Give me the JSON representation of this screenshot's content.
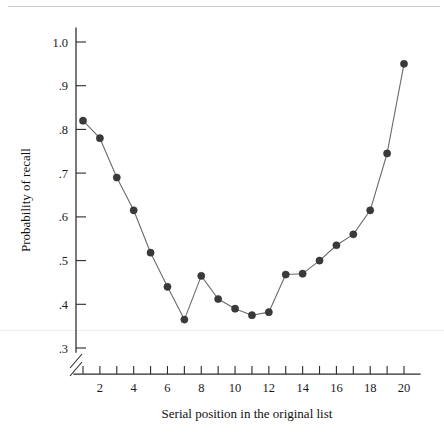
{
  "chart_data": {
    "type": "line",
    "title": "",
    "subtitle": "",
    "xlabel": "Serial position in the original list",
    "ylabel": "Probability of recall",
    "x": [
      1,
      2,
      3,
      4,
      5,
      6,
      7,
      8,
      9,
      10,
      11,
      12,
      13,
      14,
      15,
      16,
      17,
      18,
      19,
      20
    ],
    "values": [
      0.82,
      0.78,
      0.69,
      0.615,
      0.518,
      0.44,
      0.365,
      0.465,
      0.412,
      0.39,
      0.375,
      0.382,
      0.468,
      0.47,
      0.5,
      0.535,
      0.56,
      0.615,
      0.745,
      0.95
    ],
    "series": [
      {
        "name": "Probability of recall",
        "values": [
          0.82,
          0.78,
          0.69,
          0.615,
          0.518,
          0.44,
          0.365,
          0.465,
          0.412,
          0.39,
          0.375,
          0.382,
          0.468,
          0.47,
          0.5,
          0.535,
          0.56,
          0.615,
          0.745,
          0.95
        ]
      }
    ],
    "xlim": [
      1,
      20
    ],
    "ylim": [
      0.3,
      1.0
    ],
    "y_ticks": [
      0.3,
      0.4,
      0.5,
      0.6,
      0.7,
      0.8,
      0.9,
      1.0
    ],
    "y_tick_labels": [
      ".3",
      ".4",
      ".5",
      ".6",
      ".7",
      ".8",
      ".9",
      "1.0"
    ],
    "x_ticks": [
      1,
      2,
      3,
      4,
      5,
      6,
      7,
      8,
      9,
      10,
      11,
      12,
      13,
      14,
      15,
      16,
      17,
      18,
      19,
      20
    ],
    "x_tick_labels": [
      "",
      "2",
      "",
      "4",
      "",
      "6",
      "",
      "8",
      "",
      "10",
      "",
      "12",
      "",
      "14",
      "",
      "16",
      "",
      "18",
      "",
      "20"
    ],
    "grid": false,
    "legend": false,
    "legend_position": "none",
    "axis_break": {
      "axis": "y",
      "below_value": 0.3,
      "style": "double-slash"
    },
    "marker": "filled-circle",
    "colors": {
      "line": "#6b6b6b",
      "marker": "#3a3a3a",
      "axis": "#2b2b2b",
      "text": "#1a1a1a",
      "background": "#ffffff"
    }
  }
}
